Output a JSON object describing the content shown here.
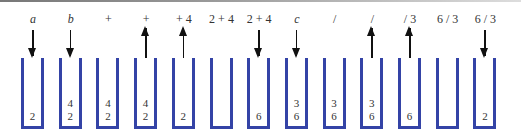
{
  "colors": {
    "stack": "#3443a6",
    "arrow": "#111111",
    "text": "#333333"
  },
  "steps": [
    {
      "label": "a",
      "italic": true,
      "arrow": "down",
      "stack": [
        "2"
      ]
    },
    {
      "label": "b",
      "italic": true,
      "arrow": "down",
      "stack": [
        "2",
        "4"
      ]
    },
    {
      "label": "+",
      "italic": false,
      "arrow": "none",
      "stack": [
        "2",
        "4"
      ]
    },
    {
      "label": "+",
      "italic": false,
      "arrow": "up",
      "stack": [
        "2",
        "4"
      ]
    },
    {
      "label": "+ 4",
      "italic": false,
      "arrow": "up",
      "stack": [
        "2"
      ]
    },
    {
      "label": "2 + 4",
      "italic": false,
      "arrow": "none",
      "stack": []
    },
    {
      "label": "2 + 4",
      "italic": false,
      "arrow": "down",
      "stack": [
        "6"
      ]
    },
    {
      "label": "c",
      "italic": true,
      "arrow": "down",
      "stack": [
        "6",
        "3"
      ]
    },
    {
      "label": "/",
      "italic": false,
      "arrow": "none",
      "stack": [
        "6",
        "3"
      ]
    },
    {
      "label": "/",
      "italic": false,
      "arrow": "up",
      "stack": [
        "6",
        "3"
      ]
    },
    {
      "label": "/ 3",
      "italic": false,
      "arrow": "up",
      "stack": [
        "6"
      ]
    },
    {
      "label": "6 / 3",
      "italic": false,
      "arrow": "none",
      "stack": []
    },
    {
      "label": "6 / 3",
      "italic": false,
      "arrow": "down",
      "stack": [
        "2"
      ]
    }
  ]
}
